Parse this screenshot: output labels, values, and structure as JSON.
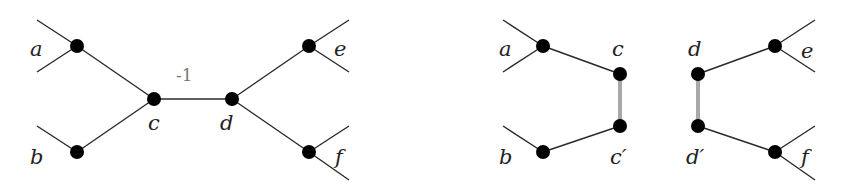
{
  "diagrams": [
    {
      "name": "original-tree",
      "edge_weight_label": "-1",
      "nodes": [
        {
          "id": "a",
          "label": "a"
        },
        {
          "id": "b",
          "label": "b"
        },
        {
          "id": "c",
          "label": "c"
        },
        {
          "id": "d",
          "label": "d"
        },
        {
          "id": "e",
          "label": "e"
        },
        {
          "id": "f",
          "label": "f"
        }
      ],
      "edges": [
        {
          "from": "a",
          "to": "c",
          "style": "normal"
        },
        {
          "from": "b",
          "to": "c",
          "style": "normal"
        },
        {
          "from": "c",
          "to": "d",
          "style": "normal",
          "weight": "-1"
        },
        {
          "from": "d",
          "to": "e",
          "style": "normal"
        },
        {
          "from": "d",
          "to": "f",
          "style": "normal"
        }
      ]
    },
    {
      "name": "split-tree",
      "nodes": [
        {
          "id": "a",
          "label": "a"
        },
        {
          "id": "b",
          "label": "b"
        },
        {
          "id": "c",
          "label": "c"
        },
        {
          "id": "c2",
          "label": "c′"
        },
        {
          "id": "d",
          "label": "d"
        },
        {
          "id": "d2",
          "label": "d′"
        },
        {
          "id": "e",
          "label": "e"
        },
        {
          "id": "f",
          "label": "f"
        }
      ],
      "edges": [
        {
          "from": "a",
          "to": "c",
          "style": "normal"
        },
        {
          "from": "b",
          "to": "c2",
          "style": "normal"
        },
        {
          "from": "c",
          "to": "c2",
          "style": "gray"
        },
        {
          "from": "d",
          "to": "d2",
          "style": "gray"
        },
        {
          "from": "d",
          "to": "e",
          "style": "normal"
        },
        {
          "from": "d2",
          "to": "f",
          "style": "normal"
        }
      ]
    }
  ],
  "colors": {
    "node": "#000000",
    "edge": "#2a2a2a",
    "highlight_edge": "#a8a8a8",
    "weight_label": "#777777"
  }
}
